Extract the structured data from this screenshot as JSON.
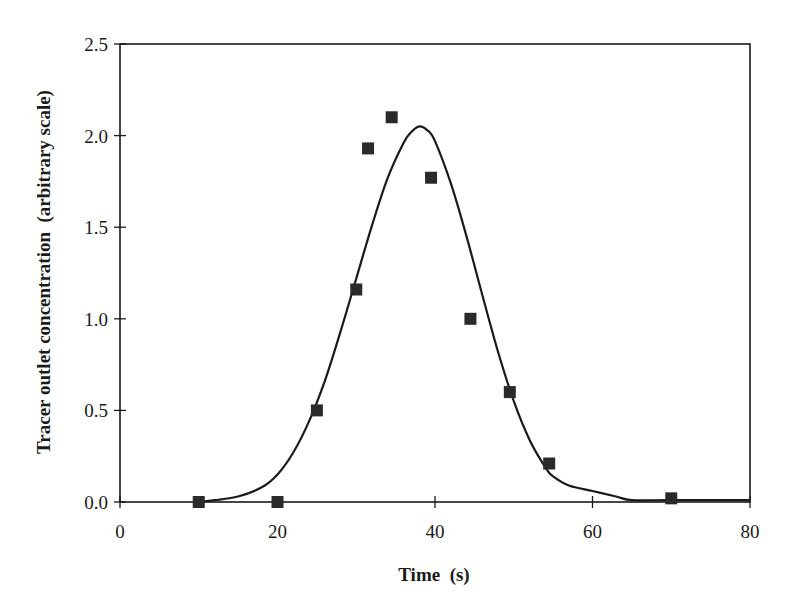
{
  "chart_data": {
    "type": "scatter",
    "title": "",
    "xlabel": "Time  (s)",
    "ylabel": "Tracer outlet concentration  (arbitrary scale)",
    "xlim": [
      0,
      80
    ],
    "ylim": [
      0,
      2.5
    ],
    "xticks": [
      0,
      20,
      40,
      60,
      80
    ],
    "xtick_labels": [
      "0",
      "20",
      "40",
      "60",
      "80"
    ],
    "yticks": [
      0,
      0.5,
      1.0,
      1.5,
      2.0,
      2.5
    ],
    "ytick_labels": [
      "0.0",
      "0.5",
      "1.0",
      "1.5",
      "2.0",
      "2.5"
    ],
    "grid": false,
    "legend": null,
    "series": [
      {
        "name": "Measured",
        "type": "scatter",
        "marker": "square",
        "color": "#2a2a2a",
        "x": [
          10,
          20,
          25,
          30,
          31.5,
          34.5,
          39.5,
          44.5,
          49.5,
          54.5,
          70
        ],
        "y": [
          0.0,
          0.0,
          0.5,
          1.16,
          1.93,
          2.1,
          1.77,
          1.0,
          0.6,
          0.21,
          0.02
        ]
      },
      {
        "name": "Model fit",
        "type": "line",
        "color": "#1a1a1a",
        "x": [
          10,
          12,
          15,
          18,
          20,
          22,
          24,
          26,
          28,
          30,
          32,
          34,
          36,
          37,
          38,
          39,
          40,
          42,
          44,
          46,
          48,
          50,
          52,
          54,
          55,
          57,
          60,
          63,
          65,
          70,
          80
        ],
        "y": [
          0.0,
          0.01,
          0.03,
          0.08,
          0.15,
          0.27,
          0.44,
          0.66,
          0.93,
          1.22,
          1.51,
          1.77,
          1.96,
          2.02,
          2.05,
          2.03,
          1.97,
          1.74,
          1.45,
          1.13,
          0.82,
          0.55,
          0.34,
          0.19,
          0.14,
          0.09,
          0.06,
          0.03,
          0.01,
          0.01,
          0.01
        ]
      }
    ]
  }
}
